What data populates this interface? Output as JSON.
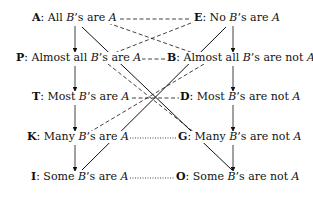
{
  "diagram": {
    "type": "square-of-opposition-extended",
    "nodes": [
      {
        "id": "A",
        "key": "A",
        "text_parts": [
          "All ",
          "B",
          "’s are ",
          "A"
        ],
        "column": "left",
        "row": 0
      },
      {
        "id": "E",
        "key": "E",
        "text_parts": [
          "No ",
          "B",
          "’s are ",
          "A"
        ],
        "column": "right",
        "row": 0
      },
      {
        "id": "P",
        "key": "P",
        "text_parts": [
          "Almost all ",
          "B",
          "’s are ",
          "A"
        ],
        "column": "left",
        "row": 1
      },
      {
        "id": "B",
        "key": "B",
        "text_parts": [
          "Almost all ",
          "B",
          "’s are not ",
          "A"
        ],
        "column": "right",
        "row": 1
      },
      {
        "id": "T",
        "key": "T",
        "text_parts": [
          "Most ",
          "B",
          "’s are ",
          "A"
        ],
        "column": "left",
        "row": 2
      },
      {
        "id": "D",
        "key": "D",
        "text_parts": [
          "Most ",
          "B",
          "’s are not ",
          "A"
        ],
        "column": "right",
        "row": 2
      },
      {
        "id": "K",
        "key": "K",
        "text_parts": [
          "Many ",
          "B",
          "’s are ",
          "A"
        ],
        "column": "left",
        "row": 3
      },
      {
        "id": "G",
        "key": "G",
        "text_parts": [
          "Many ",
          "B",
          "’s are not ",
          "A"
        ],
        "column": "right",
        "row": 3
      },
      {
        "id": "I",
        "key": "I",
        "text_parts": [
          "Some ",
          "B",
          "’s are ",
          "A"
        ],
        "column": "left",
        "row": 4
      },
      {
        "id": "O",
        "key": "O",
        "text_parts": [
          "Some ",
          "B",
          "’s are not ",
          "A"
        ],
        "column": "right",
        "row": 4
      }
    ],
    "separator": ": ",
    "edges": [
      {
        "from": "A",
        "to": "P",
        "style": "arrow"
      },
      {
        "from": "P",
        "to": "T",
        "style": "arrow"
      },
      {
        "from": "T",
        "to": "K",
        "style": "arrow"
      },
      {
        "from": "K",
        "to": "I",
        "style": "arrow"
      },
      {
        "from": "E",
        "to": "B",
        "style": "arrow"
      },
      {
        "from": "B",
        "to": "D",
        "style": "arrow"
      },
      {
        "from": "D",
        "to": "G",
        "style": "arrow"
      },
      {
        "from": "G",
        "to": "O",
        "style": "arrow"
      },
      {
        "from": "A",
        "to": "E",
        "style": "dashed"
      },
      {
        "from": "P",
        "to": "B",
        "style": "dashed"
      },
      {
        "from": "T",
        "to": "D",
        "style": "dashed"
      },
      {
        "from": "A",
        "to": "B",
        "style": "dashed"
      },
      {
        "from": "E",
        "to": "P",
        "style": "dashed"
      },
      {
        "from": "P",
        "to": "D",
        "style": "dashed"
      },
      {
        "from": "B",
        "to": "T",
        "style": "dashed"
      },
      {
        "from": "T",
        "to": "G",
        "style": "dashed"
      },
      {
        "from": "D",
        "to": "K",
        "style": "dashed"
      },
      {
        "from": "K",
        "to": "G",
        "style": "dotted"
      },
      {
        "from": "I",
        "to": "O",
        "style": "dotted"
      },
      {
        "from": "A",
        "to": "O",
        "style": "solid"
      },
      {
        "from": "E",
        "to": "I",
        "style": "solid"
      }
    ]
  }
}
